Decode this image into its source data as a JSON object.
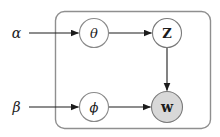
{
  "diagram": {
    "type": "graphical-model-plate-notation",
    "background_color": "#ffffff",
    "edge_color": "#1c1c1c",
    "text_color": "#1c1c1c",
    "plate": {
      "x": 55.5,
      "y": 11.5,
      "w": 155,
      "h": 117,
      "rx": 9,
      "stroke": "#8f8f8f",
      "stroke_width": 1.4,
      "fill": "none"
    },
    "nodes": [
      {
        "id": "theta",
        "label": "θ",
        "x": 94,
        "y": 33,
        "r": 14.5,
        "fill": "#ffffff",
        "stroke": "#8a8a8a",
        "stroke_width": 1.1,
        "italic": true,
        "bold": false,
        "font_size": 13
      },
      {
        "id": "z",
        "label": "Z",
        "x": 167,
        "y": 33,
        "r": 14.5,
        "fill": "#ffffff",
        "stroke": "#7a7a7a",
        "stroke_width": 1.1,
        "italic": false,
        "bold": true,
        "font_size": 13
      },
      {
        "id": "phi",
        "label": "ϕ",
        "x": 94,
        "y": 107,
        "r": 14.5,
        "fill": "#ffffff",
        "stroke": "#8a8a8a",
        "stroke_width": 1.1,
        "italic": true,
        "bold": false,
        "font_size": 13
      },
      {
        "id": "w",
        "label": "w",
        "x": 167,
        "y": 107,
        "r": 15.5,
        "fill": "#d8d8d8",
        "stroke": "#7a7a7a",
        "stroke_width": 1.1,
        "italic": false,
        "bold": true,
        "font_size": 14
      }
    ],
    "external_labels": [
      {
        "id": "alpha",
        "label": "α",
        "x": 16.5,
        "y": 33,
        "font_size": 14
      },
      {
        "id": "beta",
        "label": "β",
        "x": 16.5,
        "y": 107,
        "font_size": 14
      }
    ],
    "edges": [
      {
        "from": "alpha",
        "to": "theta",
        "x1": 29,
        "y1": 33,
        "x2": 78.5,
        "y2": 33
      },
      {
        "from": "theta",
        "to": "z",
        "x1": 108.5,
        "y1": 33,
        "x2": 151.5,
        "y2": 33
      },
      {
        "from": "z",
        "to": "w",
        "x1": 167,
        "y1": 47.5,
        "x2": 167,
        "y2": 90.5
      },
      {
        "from": "beta",
        "to": "phi",
        "x1": 29,
        "y1": 107,
        "x2": 78.5,
        "y2": 107
      },
      {
        "from": "phi",
        "to": "w",
        "x1": 108.5,
        "y1": 107,
        "x2": 150.5,
        "y2": 107
      }
    ]
  }
}
